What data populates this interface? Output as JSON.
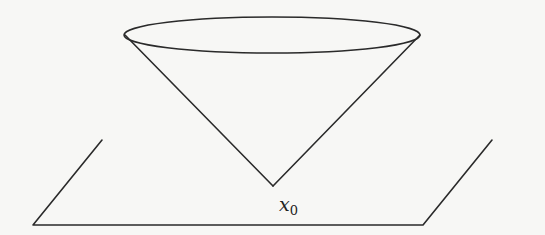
{
  "diagram": {
    "colors": {
      "background": "#f7f7f5",
      "stroke": "#2a2a2a"
    },
    "cone": {
      "apex": [
        273,
        186
      ],
      "top_ellipse": {
        "cx": 272,
        "cy": 35,
        "rx": 148,
        "ry": 18
      },
      "left_generator_end": [
        125,
        35
      ],
      "right_generator_end": [
        420,
        35
      ]
    },
    "plane": {
      "points": [
        [
          102,
          140
        ],
        [
          33,
          225
        ],
        [
          423,
          225
        ],
        [
          492,
          140
        ]
      ],
      "open_top_edge": true
    },
    "apex_label": {
      "base": "x",
      "subscript": "0"
    }
  }
}
